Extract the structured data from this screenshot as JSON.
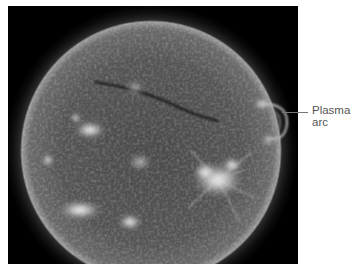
{
  "figure": {
    "annotations": [
      {
        "id": "plasma-arc",
        "lines": [
          "Plasma",
          "arc"
        ],
        "target": "right limb loop"
      }
    ]
  },
  "colors": {
    "background": "#ffffff",
    "photo_background": "#000000",
    "label_text": "#555555",
    "callout_line": "#777777"
  }
}
